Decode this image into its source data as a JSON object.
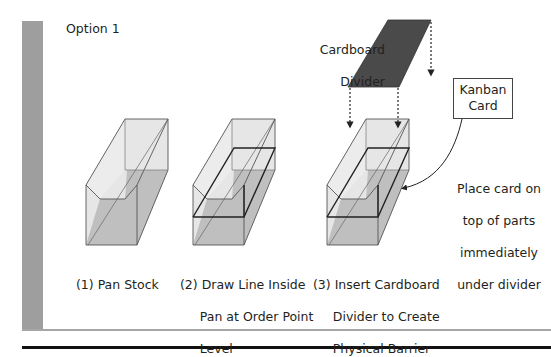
{
  "title": "Option 1",
  "divider_label": [
    "Cardboard",
    "Divider"
  ],
  "kanban_card_label": [
    "Kanban",
    "Card"
  ],
  "placement_note": [
    "Place card on",
    "top of parts",
    "immediately",
    "under divider"
  ],
  "steps": [
    {
      "lines": [
        "(1) Pan Stock"
      ]
    },
    {
      "lines": [
        "(2) Draw Line Inside",
        "     Pan at Order Point",
        "     Level"
      ]
    },
    {
      "lines": [
        "(3) Insert Cardboard",
        "     Divider to Create",
        "     Physical Barrier"
      ]
    }
  ],
  "colors": {
    "sidebar": "#9e9e9e",
    "divider_fill": "#4a4a4a",
    "pan_light": "#e4e4e4",
    "pan_dark": "#bdbdbd",
    "stroke": "#555555"
  }
}
